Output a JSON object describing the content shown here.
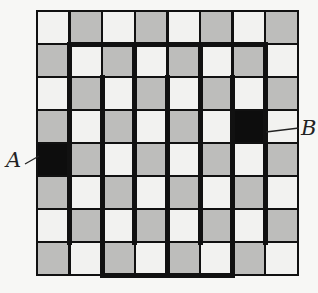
{
  "diagram": {
    "rows": 8,
    "cols": 8,
    "origin": {
      "x": 37,
      "y": 11
    },
    "cell_w": 32.6,
    "cell_h": 33,
    "colors": {
      "light": "#f2f2f0",
      "shaded": "#bdbdbb",
      "marked": "#0d0d0d",
      "line": "#111111",
      "background": "#f7f7f5"
    },
    "checker_first_cell": "light",
    "marked_cells": [
      {
        "name": "A",
        "row": 5,
        "col": 1
      },
      {
        "name": "B",
        "row": 4,
        "col": 7
      }
    ],
    "thin_line_width": 2.5,
    "thick_line_width": 5,
    "thick_horizontal_walls": [
      {
        "between_rows": [
          1,
          2
        ],
        "from_col": 2,
        "to_col": 7
      },
      {
        "edge": "bottom",
        "from_col": 3,
        "to_col": 6
      }
    ],
    "thick_vertical_walls": [
      {
        "between_cols": [
          1,
          2
        ],
        "from_row": 2,
        "to_row": 7
      },
      {
        "between_cols": [
          2,
          3
        ],
        "from_row": 3,
        "to_row": 8
      },
      {
        "between_cols": [
          3,
          4
        ],
        "from_row": 2,
        "to_row": 7
      },
      {
        "between_cols": [
          4,
          5
        ],
        "from_row": 3,
        "to_row": 8
      },
      {
        "between_cols": [
          5,
          6
        ],
        "from_row": 2,
        "to_row": 7
      },
      {
        "between_cols": [
          6,
          7
        ],
        "from_row": 3,
        "to_row": 8
      },
      {
        "between_cols": [
          7,
          8
        ],
        "from_row": 2,
        "to_row": 7
      }
    ],
    "labels": [
      {
        "text": "A",
        "x": 6,
        "y": 148,
        "leader": {
          "x1": 25,
          "y1": 164,
          "x2": 39,
          "y2": 156
        }
      },
      {
        "text": "B",
        "x": 301,
        "y": 116,
        "leader": {
          "x1": 266,
          "y1": 132,
          "x2": 299,
          "y2": 128
        }
      }
    ]
  }
}
